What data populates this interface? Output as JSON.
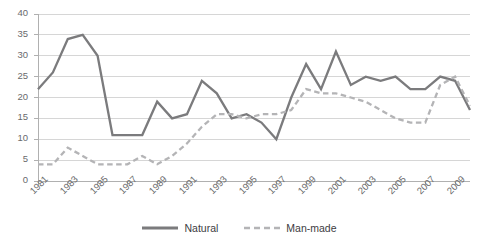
{
  "chart_data": {
    "type": "line",
    "title": "",
    "xlabel": "",
    "ylabel": "",
    "ylim": [
      0,
      40
    ],
    "ytick_labels": [
      "0",
      "5",
      "10",
      "15",
      "20",
      "25",
      "30",
      "35",
      "40"
    ],
    "ytick_values": [
      0,
      5,
      10,
      15,
      20,
      25,
      30,
      35,
      40
    ],
    "grid": true,
    "grid_axis": "y",
    "legend_position": "bottom-center",
    "x": [
      1981,
      1982,
      1983,
      1984,
      1985,
      1986,
      1987,
      1988,
      1989,
      1990,
      1991,
      1992,
      1993,
      1994,
      1995,
      1996,
      1997,
      1998,
      1999,
      2000,
      2001,
      2002,
      2003,
      2004,
      2005,
      2006,
      2007,
      2008,
      2009,
      2010
    ],
    "xtick_labels": [
      "1981",
      "1983",
      "1985",
      "1987",
      "1989",
      "1991",
      "1993",
      "1995",
      "1997",
      "1999",
      "2001",
      "2003",
      "2005",
      "2007",
      "2009"
    ],
    "xtick_values": [
      1981,
      1983,
      1985,
      1987,
      1989,
      1991,
      1993,
      1995,
      1997,
      1999,
      2001,
      2003,
      2005,
      2007,
      2009
    ],
    "series": [
      {
        "name": "Natural",
        "style": "solid",
        "color": "#7b7b7d",
        "values": [
          22,
          26,
          34,
          35,
          30,
          11,
          11,
          11,
          19,
          15,
          16,
          24,
          21,
          15,
          16,
          14,
          10,
          20,
          28,
          22,
          31,
          23,
          25,
          24,
          25,
          22,
          22,
          25,
          24,
          17
        ]
      },
      {
        "name": "Man-made",
        "style": "dashed",
        "color": "#b4b4b6",
        "values": [
          4,
          4,
          8,
          6,
          4,
          4,
          4,
          6,
          4,
          6,
          9,
          13,
          16,
          16,
          15,
          16,
          16,
          17,
          22,
          21,
          21,
          20,
          19,
          17,
          15,
          14,
          14,
          23,
          25,
          18
        ]
      }
    ]
  },
  "legend": {
    "items": [
      {
        "label": "Natural",
        "style": "solid",
        "color": "#7b7b7d"
      },
      {
        "label": "Man-made",
        "style": "dashed",
        "color": "#b4b4b6"
      }
    ]
  },
  "colors": {
    "natural": "#7b7b7d",
    "manmade": "#b4b4b6",
    "grid": "#d6d6d6",
    "axis": "#b0b0b0",
    "tick_text": "#6a6a6c"
  }
}
